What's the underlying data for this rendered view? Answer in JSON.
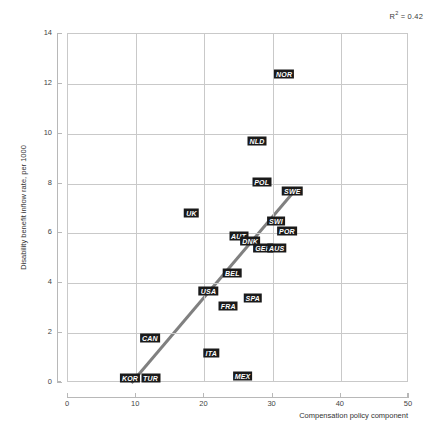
{
  "chart_data": {
    "type": "scatter",
    "title": "",
    "xlabel": "Compensation policy component",
    "ylabel": "Disability benefit inflow rate, per 1000",
    "xlim": [
      0,
      50
    ],
    "ylim": [
      0,
      14
    ],
    "xticks": [
      0,
      10,
      20,
      30,
      40,
      50
    ],
    "yticks": [
      0,
      2,
      4,
      6,
      8,
      10,
      12,
      14
    ],
    "grid": true,
    "legend": "none",
    "annotations": [
      {
        "name": "r-squared",
        "text": "R2 = 0.42",
        "value": 0.42
      }
    ],
    "points": [
      {
        "label": "NOR",
        "x": 31.7,
        "y": 12.4
      },
      {
        "label": "NLD",
        "x": 27.7,
        "y": 9.7
      },
      {
        "label": "POL",
        "x": 28.4,
        "y": 8.05
      },
      {
        "label": "SWE",
        "x": 32.9,
        "y": 7.7
      },
      {
        "label": "UK",
        "x": 18.1,
        "y": 6.8
      },
      {
        "label": "SWI",
        "x": 30.5,
        "y": 6.5
      },
      {
        "label": "POR",
        "x": 32.1,
        "y": 6.1
      },
      {
        "label": "AUT",
        "x": 25.0,
        "y": 5.9
      },
      {
        "label": "DNK",
        "x": 26.7,
        "y": 5.7
      },
      {
        "label": "GER",
        "x": 28.6,
        "y": 5.4
      },
      {
        "label": "AUS",
        "x": 30.6,
        "y": 5.4
      },
      {
        "label": "BEL",
        "x": 24.1,
        "y": 4.4
      },
      {
        "label": "USA",
        "x": 20.6,
        "y": 3.7
      },
      {
        "label": "SPA",
        "x": 27.1,
        "y": 3.4
      },
      {
        "label": "FRA",
        "x": 23.5,
        "y": 3.1
      },
      {
        "label": "CAN",
        "x": 12.0,
        "y": 1.8
      },
      {
        "label": "ITA",
        "x": 21.0,
        "y": 1.2
      },
      {
        "label": "MEX",
        "x": 25.6,
        "y": 0.3
      },
      {
        "label": "KOR",
        "x": 9.1,
        "y": 0.2
      },
      {
        "label": "TUR",
        "x": 12.1,
        "y": 0.2
      }
    ],
    "trendline": {
      "x0": 9.3,
      "y0": 0.0,
      "x1": 33.2,
      "y1": 7.7,
      "color": "#808080",
      "width": 3
    },
    "colors": {
      "label_background": "#1a1a1a",
      "label_text": "#ffffff",
      "grid": "#c9c9c9",
      "axis": "#b8b8b8",
      "trend": "#808080",
      "text": "#333333"
    }
  },
  "axis_tick_labels": {
    "x": [
      "0",
      "10",
      "20",
      "30",
      "40",
      "50"
    ],
    "y": [
      "0",
      "2",
      "4",
      "6",
      "8",
      "10",
      "12",
      "14"
    ]
  },
  "r2": {
    "prefix": "R",
    "exponent": "2",
    "suffix": " = 0.42"
  }
}
